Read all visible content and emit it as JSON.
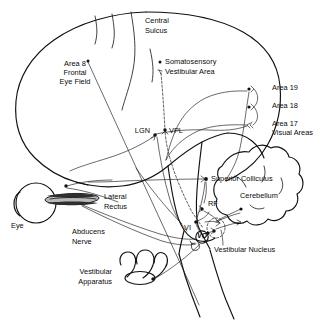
{
  "figure": {
    "domain": "Diagram",
    "background_color": "#ffffff",
    "ink_color": "#111111",
    "muscle_fill": "#b9b9b9"
  },
  "labels": {
    "central_sulcus_line1": "Central",
    "central_sulcus_line2": "Sulcus",
    "somatosensory_line1": "Somatosensory",
    "somatosensory_line2": "Vestibular Area",
    "area8_line1": "Area 8",
    "area8_line2": "Frontal",
    "area8_line3": "Eye Field",
    "area19": "Area 19",
    "area18": "Area 18",
    "area17_line1": "Area 17",
    "area17_line2": "Visual Areas",
    "lgn": "LGN",
    "vpl": "VPL",
    "superior_colliculus": "Superior Colliculus",
    "cerebellum": "Cerebellum",
    "rf": "RF",
    "vi": "VI",
    "vo": "VO",
    "vestibular_nucleus": "Vestibular Nucleus",
    "lateral_rectus_line1": "Lateral",
    "lateral_rectus_line2": "Rectus",
    "eye": "Eye",
    "abducens_line1": "Abducens",
    "abducens_line2": "Nerve",
    "vestibular_apparatus_line1": "Vestibular",
    "vestibular_apparatus_line2": "Apparatus"
  },
  "structures": [
    {
      "name": "cerebrum",
      "label": "Cerebral cortex outline"
    },
    {
      "name": "cerebellum",
      "label": "Cerebellum"
    },
    {
      "name": "brainstem",
      "label": "Brainstem"
    },
    {
      "name": "eye",
      "label": "Eye"
    },
    {
      "name": "lateral-rectus-muscle",
      "label": "Lateral Rectus"
    },
    {
      "name": "vestibular-apparatus",
      "label": "Vestibular Apparatus"
    }
  ]
}
